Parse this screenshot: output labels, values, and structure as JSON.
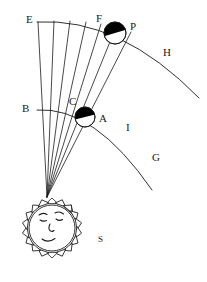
{
  "figure": {
    "kind": "astronomical-diagram",
    "background_color": "#ffffff",
    "ink_color": "#1a1a1a",
    "shadow_fill_color": "#000000"
  },
  "labels": [
    {
      "id": "E",
      "text": "E",
      "x": 26,
      "y": 14,
      "size": "normal"
    },
    {
      "id": "F",
      "text": "F",
      "x": 96,
      "y": 13,
      "size": "normal"
    },
    {
      "id": "P",
      "text": "P",
      "x": 130,
      "y": 21,
      "size": "normal"
    },
    {
      "id": "H",
      "text": "H",
      "x": 163,
      "y": 47,
      "size": "normal"
    },
    {
      "id": "B",
      "text": "B",
      "x": 22,
      "y": 103,
      "size": "normal"
    },
    {
      "id": "C",
      "text": "C",
      "x": 69,
      "y": 96,
      "size": "normal"
    },
    {
      "id": "A",
      "text": "A",
      "x": 99,
      "y": 113,
      "size": "normal"
    },
    {
      "id": "I",
      "text": "I",
      "x": 126,
      "y": 122,
      "size": "normal"
    },
    {
      "id": "G",
      "text": "G",
      "x": 152,
      "y": 152,
      "size": "normal"
    },
    {
      "id": "S",
      "text": "S",
      "x": 98,
      "y": 235,
      "size": "small"
    }
  ],
  "sun": {
    "name": "sun-with-face",
    "center_x": 52,
    "center_y": 228,
    "body_radius": 30,
    "ray_count": 18,
    "ray_length": 9,
    "has_face": true,
    "face_features": [
      "left-eyebrow",
      "right-eyebrow",
      "left-eye",
      "right-eye",
      "nose",
      "mouth"
    ]
  },
  "rays": {
    "name": "light-rays",
    "origin_x": 47,
    "origin_y": 197,
    "count": 7,
    "endpoints": [
      {
        "x": 38,
        "y": 22
      },
      {
        "x": 54,
        "y": 21
      },
      {
        "x": 70,
        "y": 21
      },
      {
        "x": 86,
        "y": 22
      },
      {
        "x": 101,
        "y": 24
      },
      {
        "x": 116,
        "y": 27
      },
      {
        "x": 131,
        "y": 32
      }
    ]
  },
  "arcs": [
    {
      "name": "outer-orbit-arc",
      "from_label": "E",
      "through_label": "F",
      "to_label": "H",
      "start_x": 37,
      "start_y": 22,
      "end_x": 199,
      "end_y": 98,
      "control_x": 120,
      "control_y": 17
    },
    {
      "name": "inner-orbit-arc",
      "from_label": "B",
      "through_label": "A",
      "to_label": "G",
      "start_x": 37,
      "start_y": 110,
      "end_x": 152,
      "end_y": 190,
      "control_x": 94,
      "control_y": 106
    }
  ],
  "spheres": [
    {
      "name": "outer-sphere-P",
      "label_near": "P",
      "center_x": 115,
      "center_y": 33,
      "radius": 11,
      "shaded_half": "upper",
      "shadow_tilt_degrees": -16
    },
    {
      "name": "inner-sphere-A",
      "label_near": "A",
      "center_x": 85,
      "center_y": 117,
      "radius": 10,
      "shaded_half": "upper",
      "shadow_tilt_degrees": -14
    }
  ]
}
